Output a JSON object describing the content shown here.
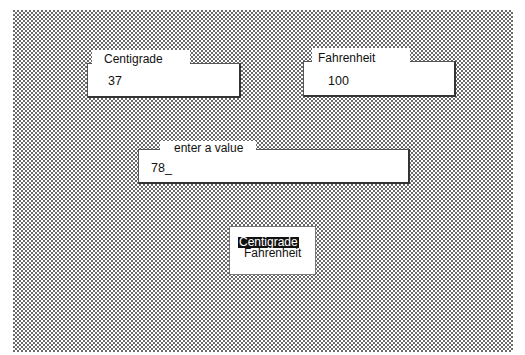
{
  "fields": {
    "centigrade": {
      "label": "Centigrade",
      "value": "37"
    },
    "fahrenheit": {
      "label": "Fahrenheit",
      "value": "100"
    },
    "entry": {
      "label": "enter a value",
      "value": "78_"
    }
  },
  "unit_selector": {
    "options": [
      {
        "label": "Centigrade",
        "selected": true
      },
      {
        "label": "Fahrenheit",
        "selected": false
      }
    ]
  },
  "colors": {
    "background_pattern": "#6a6a6a",
    "field_background": "#ffffff",
    "selection_background": "#111111",
    "selection_text": "#ffffff"
  }
}
